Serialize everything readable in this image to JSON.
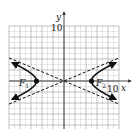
{
  "chart_data": {
    "type": "line",
    "title": "",
    "xlabel": "x",
    "ylabel": "y",
    "xlim": [
      -10,
      10
    ],
    "ylim": [
      -9,
      10
    ],
    "x_tick_label": "10",
    "y_tick_label": "10",
    "grid": true,
    "grid_major_step": 2,
    "grid_minor_step": 1,
    "series": [
      {
        "name": "hyperbola-left-branch",
        "style": "solid-arrows",
        "vertex": [
          -5,
          0
        ],
        "x_end": -9.4,
        "a": 5,
        "b": 2.1
      },
      {
        "name": "hyperbola-right-branch",
        "style": "solid-arrows",
        "vertex": [
          5,
          0
        ],
        "x_end": 9.4,
        "a": 5,
        "b": 2.1
      },
      {
        "name": "asymptote-1",
        "style": "dashed",
        "slope": 0.42,
        "x_range": [
          -10,
          10
        ]
      },
      {
        "name": "asymptote-2",
        "style": "dashed",
        "slope": -0.42,
        "x_range": [
          -10,
          10
        ]
      }
    ],
    "points": [
      {
        "label": "F",
        "subscript": "1",
        "x": -5,
        "y": 0
      },
      {
        "label": "F",
        "subscript": "2",
        "x": 5,
        "y": 0
      }
    ],
    "colors": {
      "curve": "#111111",
      "grid": "#9a9a9a",
      "axis": "#333333"
    }
  }
}
